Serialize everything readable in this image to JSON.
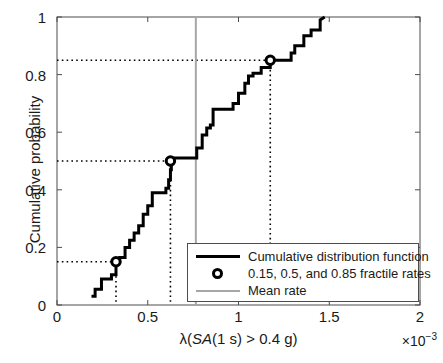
{
  "chart_data": {
    "type": "line",
    "subtype": "empirical-cumulative-distribution-step",
    "title": "",
    "xlabel": "λ(SA(1 s) > 0.4 g)",
    "ylabel": "Cumulative probability",
    "x_exponent_label": "×10",
    "x_exponent_value": "−3",
    "xlim": [
      0,
      2
    ],
    "ylim": [
      0,
      1
    ],
    "xticks": [
      0,
      0.5,
      1,
      1.5,
      2
    ],
    "xtick_labels": [
      "0",
      "0.5",
      "1",
      "1.5",
      "2"
    ],
    "yticks": [
      0,
      0.2,
      0.4,
      0.6,
      0.8,
      1
    ],
    "ytick_labels": [
      "0",
      "0.2",
      "0.4",
      "0.6",
      "0.8",
      "1"
    ],
    "grid": false,
    "legend_position": "lower-right",
    "series": [
      {
        "name": "Cumulative distribution function",
        "type": "step",
        "color": "#000000",
        "x": [
          0.19,
          0.21,
          0.21,
          0.245,
          0.245,
          0.3,
          0.3,
          0.325,
          0.325,
          0.345,
          0.345,
          0.375,
          0.375,
          0.4,
          0.4,
          0.425,
          0.425,
          0.45,
          0.45,
          0.475,
          0.475,
          0.5,
          0.5,
          0.525,
          0.525,
          0.6,
          0.6,
          0.615,
          0.615,
          0.625,
          0.625,
          0.63,
          0.63,
          0.77,
          0.77,
          0.8,
          0.8,
          0.825,
          0.825,
          0.845,
          0.845,
          0.86,
          0.86,
          0.97,
          0.97,
          1.0,
          1.0,
          1.035,
          1.035,
          1.055,
          1.055,
          1.08,
          1.08,
          1.125,
          1.125,
          1.175,
          1.175,
          1.29,
          1.29,
          1.31,
          1.31,
          1.36,
          1.36,
          1.4,
          1.4,
          1.45,
          1.45,
          1.475
        ],
        "y": [
          0.03,
          0.03,
          0.055,
          0.055,
          0.09,
          0.09,
          0.105,
          0.105,
          0.15,
          0.15,
          0.165,
          0.165,
          0.2,
          0.2,
          0.225,
          0.225,
          0.25,
          0.25,
          0.275,
          0.275,
          0.315,
          0.315,
          0.345,
          0.345,
          0.39,
          0.39,
          0.405,
          0.405,
          0.435,
          0.435,
          0.47,
          0.47,
          0.51,
          0.51,
          0.545,
          0.545,
          0.59,
          0.59,
          0.615,
          0.615,
          0.625,
          0.625,
          0.68,
          0.68,
          0.7,
          0.7,
          0.735,
          0.735,
          0.77,
          0.77,
          0.795,
          0.795,
          0.805,
          0.805,
          0.825,
          0.825,
          0.85,
          0.85,
          0.875,
          0.875,
          0.9,
          0.9,
          0.935,
          0.935,
          0.955,
          0.955,
          0.99,
          1.0
        ]
      }
    ],
    "fractile_markers": {
      "name": "0.15, 0.5, and 0.85 fractile rates",
      "marker": "circle-open",
      "color": "#000000",
      "points": [
        {
          "fractile": 0.15,
          "x": 0.325,
          "y": 0.15
        },
        {
          "fractile": 0.5,
          "x": 0.625,
          "y": 0.5
        },
        {
          "fractile": 0.85,
          "x": 1.175,
          "y": 0.85
        }
      ]
    },
    "mean_rate": {
      "name": "Mean rate",
      "color": "#a6a6a6",
      "x": 0.765
    },
    "guide_lines": {
      "style": "dotted",
      "color": "#000000",
      "horizontal_y": [
        0.15,
        0.5,
        0.85
      ],
      "vertical_x": [
        0.325,
        0.625,
        1.175
      ]
    }
  },
  "legend": {
    "entries": [
      {
        "label": "Cumulative distribution function",
        "key": "thick-black-line"
      },
      {
        "label": "0.15, 0.5, and 0.85 fractile rates",
        "key": "open-circle-marker"
      },
      {
        "label": "Mean rate",
        "key": "gray-line"
      }
    ]
  },
  "axes": {
    "x_title_parts": {
      "lambda": "λ(",
      "sa_italic": "SA",
      "rest": "(1 s) > 0.4 g)"
    }
  }
}
